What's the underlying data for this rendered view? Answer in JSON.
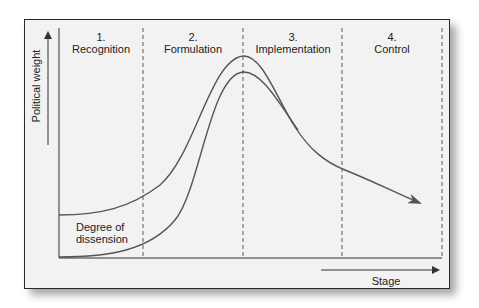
{
  "diagram": {
    "y_axis": {
      "label": "Political weight",
      "icon": "arrow-up-icon"
    },
    "x_axis": {
      "label": "Stage",
      "icon": "arrow-right-icon"
    },
    "stages": [
      {
        "number": "1.",
        "name": "Recognition"
      },
      {
        "number": "2.",
        "name": "Formulation"
      },
      {
        "number": "3.",
        "name": "Implementation"
      },
      {
        "number": "4.",
        "name": "Control"
      }
    ],
    "curves": [
      {
        "name": "Political weight curve",
        "shape": "rises from low plateau, peaks at stage 2/3 boundary, declines with arrowhead into stage 4"
      },
      {
        "name": "Degree of dissension",
        "label": "Degree of\ndissension",
        "shape": "rises from baseline, peaks at stage 2/3 boundary slightly below upper curve, merges with upper curve in stage 3"
      }
    ],
    "dissension_label_line1": "Degree of",
    "dissension_label_line2": "dissension",
    "colors": {
      "background": "#f2f2f2",
      "frame": "#2a2a2a",
      "curve": "#555555",
      "text": "#222222"
    }
  }
}
